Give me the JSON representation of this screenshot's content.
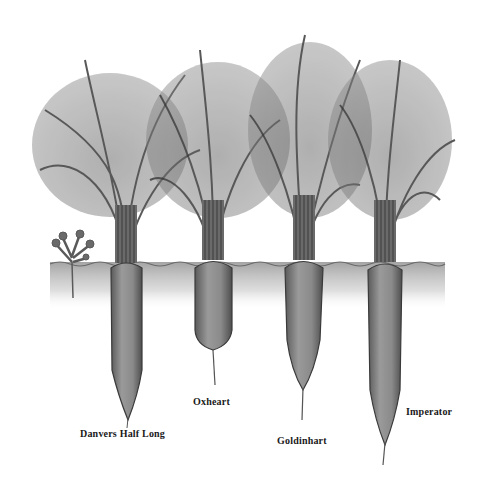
{
  "illustration": {
    "subject": "carrot varieties",
    "colors": {
      "background": "#ffffff",
      "foliage": "#6a6a6a",
      "foliage_dark": "#3c3c3c",
      "root": "#8a8a8a",
      "root_dark": "#4a4a4a",
      "soil": "#b8b8b8",
      "label": "#1a1a1a"
    },
    "carrots": [
      {
        "name": "Danvers Half Long",
        "label_x": 80,
        "label_y": 428
      },
      {
        "name": "Oxheart",
        "label_x": 193,
        "label_y": 396
      },
      {
        "name": "Goldinhart",
        "label_x": 277,
        "label_y": 435
      },
      {
        "name": "Imperator",
        "label_x": 406,
        "label_y": 406
      }
    ]
  }
}
